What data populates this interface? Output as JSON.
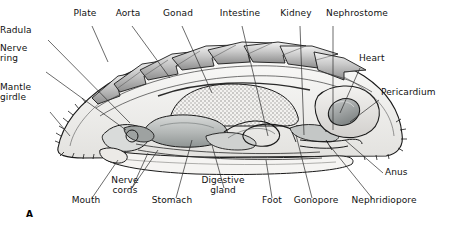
{
  "figure": {
    "marker": "A",
    "width": 453,
    "height": 233,
    "background": "#ffffff"
  },
  "palette": {
    "ink": "#1a1a1a",
    "leader": "#2b2b2b",
    "plate_light": "#dcdcdc",
    "plate_mid": "#b4b4b4",
    "plate_dark": "#8a8a8a",
    "body_pale": "#f0efed",
    "girdle": "#d6d4d1",
    "gonad": "#efeeec",
    "stomach": "#b9bcbb",
    "gland": "#cfd1d0",
    "intestine": "#c9cbca",
    "heart": "#9fa3a3",
    "pericardium": "#e4e3e1",
    "foot": "#f5f4f2"
  },
  "labels": [
    {
      "id": "radula",
      "text": "Radula",
      "align": "right",
      "x": 8,
      "y": 35,
      "lines": [
        "Radula"
      ]
    },
    {
      "id": "nerve-ring",
      "text": "Nerve ring",
      "align": "right",
      "x": 8,
      "y": 63,
      "lines": [
        "Nerve",
        "ring"
      ]
    },
    {
      "id": "mantle-girdle",
      "text": "Mantle girdle",
      "align": "right",
      "x": 8,
      "y": 102,
      "lines": [
        "Mantle",
        "girdle"
      ]
    },
    {
      "id": "plate",
      "text": "Plate",
      "align": "center",
      "x": 85,
      "y": 18,
      "lines": [
        "Plate"
      ]
    },
    {
      "id": "aorta",
      "text": "Aorta",
      "align": "center",
      "x": 128,
      "y": 18,
      "lines": [
        "Aorta"
      ]
    },
    {
      "id": "gonad",
      "text": "Gonad",
      "align": "center",
      "x": 178,
      "y": 18,
      "lines": [
        "Gonad"
      ]
    },
    {
      "id": "intestine",
      "text": "Intestine",
      "align": "center",
      "x": 240,
      "y": 18,
      "lines": [
        "Intestine"
      ]
    },
    {
      "id": "kidney",
      "text": "Kidney",
      "align": "center",
      "x": 296,
      "y": 18,
      "lines": [
        "Kidney"
      ]
    },
    {
      "id": "nephrostome",
      "text": "Nephrostome",
      "align": "center",
      "x": 357,
      "y": 18,
      "lines": [
        "Nephrostome"
      ]
    },
    {
      "id": "heart",
      "text": "Heart",
      "align": "left",
      "x": 359,
      "y": 63,
      "lines": [
        "Heart"
      ]
    },
    {
      "id": "pericardium",
      "text": "Pericardium",
      "align": "left",
      "x": 381,
      "y": 97,
      "lines": [
        "Pericardium"
      ]
    },
    {
      "id": "anus",
      "text": "Anus",
      "align": "left",
      "x": 385,
      "y": 177,
      "lines": [
        "Anus"
      ]
    },
    {
      "id": "mouth",
      "text": "Mouth",
      "align": "center",
      "x": 86,
      "y": 205,
      "lines": [
        "Mouth"
      ]
    },
    {
      "id": "nerve-cords",
      "text": "Nerve cords",
      "align": "center",
      "x": 125,
      "y": 195,
      "lines": [
        "Nerve",
        "cords"
      ]
    },
    {
      "id": "stomach",
      "text": "Stomach",
      "align": "center",
      "x": 172,
      "y": 205,
      "lines": [
        "Stomach"
      ]
    },
    {
      "id": "digestive-gland",
      "text": "Digestive gland",
      "align": "center",
      "x": 223,
      "y": 195,
      "lines": [
        "Digestive",
        "gland"
      ]
    },
    {
      "id": "foot",
      "text": "Foot",
      "align": "center",
      "x": 272,
      "y": 205,
      "lines": [
        "Foot"
      ]
    },
    {
      "id": "gonopore",
      "text": "Gonopore",
      "align": "center",
      "x": 316,
      "y": 205,
      "lines": [
        "Gonopore"
      ]
    },
    {
      "id": "nephridiopore",
      "text": "Nephridiopore",
      "align": "center",
      "x": 384,
      "y": 205,
      "lines": [
        "Nephridiopore"
      ]
    }
  ],
  "leaders": [
    {
      "id": "radula",
      "x1": 48,
      "y1": 40,
      "x2": 130,
      "y2": 123
    },
    {
      "id": "nerve-ring",
      "x1": 46,
      "y1": 72,
      "x2": 126,
      "y2": 130
    },
    {
      "id": "mantle-girdle",
      "x1": 50,
      "y1": 112,
      "x2": 70,
      "y2": 136
    },
    {
      "id": "plate",
      "x1": 92,
      "y1": 26,
      "x2": 108,
      "y2": 62
    },
    {
      "id": "aorta",
      "x1": 132,
      "y1": 26,
      "x2": 170,
      "y2": 78
    },
    {
      "id": "gonad",
      "x1": 182,
      "y1": 26,
      "x2": 212,
      "y2": 93
    },
    {
      "id": "intestine",
      "x1": 242,
      "y1": 26,
      "x2": 268,
      "y2": 136
    },
    {
      "id": "kidney",
      "x1": 300,
      "y1": 26,
      "x2": 304,
      "y2": 135
    },
    {
      "id": "nephrostome",
      "x1": 333,
      "y1": 26,
      "x2": 333,
      "y2": 130
    },
    {
      "id": "heart",
      "x1": 360,
      "y1": 68,
      "x2": 340,
      "y2": 113
    },
    {
      "id": "pericardium",
      "x1": 379,
      "y1": 100,
      "x2": 350,
      "y2": 122
    },
    {
      "id": "anus",
      "x1": 383,
      "y1": 173,
      "x2": 345,
      "y2": 140
    },
    {
      "id": "mouth",
      "x1": 92,
      "y1": 198,
      "x2": 118,
      "y2": 160
    },
    {
      "id": "nerve-cords-a",
      "x1": 132,
      "y1": 188,
      "x2": 148,
      "y2": 153
    },
    {
      "id": "nerve-cords-b",
      "x1": 132,
      "y1": 188,
      "x2": 158,
      "y2": 150
    },
    {
      "id": "stomach",
      "x1": 176,
      "y1": 198,
      "x2": 192,
      "y2": 140
    },
    {
      "id": "digestive-gland",
      "x1": 224,
      "y1": 188,
      "x2": 212,
      "y2": 145
    },
    {
      "id": "foot",
      "x1": 272,
      "y1": 198,
      "x2": 266,
      "y2": 160
    },
    {
      "id": "gonopore",
      "x1": 312,
      "y1": 198,
      "x2": 296,
      "y2": 135
    },
    {
      "id": "nephridiopore",
      "x1": 372,
      "y1": 198,
      "x2": 330,
      "y2": 146
    }
  ]
}
